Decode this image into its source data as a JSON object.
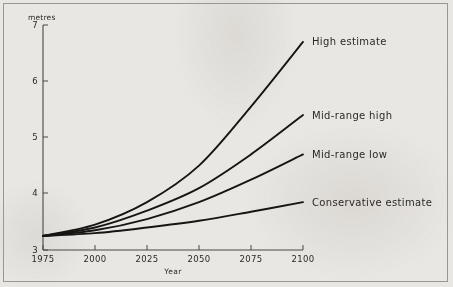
{
  "chart_data": {
    "type": "line",
    "title": "",
    "xlabel": "Year",
    "ylabel": "metres",
    "yunit_label": "metres",
    "xlim": [
      1975,
      2100
    ],
    "ylim": [
      3,
      7
    ],
    "grid": false,
    "legend_position": "inline-right-of-line-ends",
    "xticks": [
      "1975",
      "2000",
      "2025",
      "2050",
      "2075",
      "2100"
    ],
    "xtick_values": [
      1975,
      2000,
      2025,
      2050,
      2075,
      2100
    ],
    "yticks": [
      "3",
      "4",
      "5",
      "6",
      "7"
    ],
    "ytick_values": [
      3,
      4,
      5,
      6,
      7
    ],
    "x": [
      1975,
      2000,
      2025,
      2050,
      2075,
      2100
    ],
    "series": [
      {
        "name": "High estimate",
        "label": "High estimate",
        "values": [
          3.25,
          3.45,
          3.85,
          4.5,
          5.55,
          6.7
        ]
      },
      {
        "name": "Mid-range high",
        "label": "Mid-range high",
        "values": [
          3.25,
          3.4,
          3.7,
          4.1,
          4.7,
          5.4
        ]
      },
      {
        "name": "Mid-range low",
        "label": "Mid-range low",
        "values": [
          3.25,
          3.35,
          3.55,
          3.85,
          4.25,
          4.7
        ]
      },
      {
        "name": "Conservative estimate",
        "label": "Conservative estimate",
        "values": [
          3.25,
          3.3,
          3.4,
          3.52,
          3.68,
          3.85
        ]
      }
    ],
    "colors": {
      "line": "#171513",
      "axis": "#4a4744",
      "text": "#2b2926",
      "background": "#e9e7e4",
      "frame": "#9a9792"
    }
  }
}
